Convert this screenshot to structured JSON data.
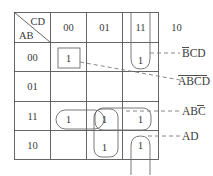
{
  "kmap": {
    "title": "Karnaugh Map",
    "corner": {
      "col_var_label": "CD",
      "row_var_label": "AB"
    },
    "column_headers": [
      "00",
      "01",
      "11",
      "10"
    ],
    "row_headers": [
      "00",
      "01",
      "11",
      "10"
    ],
    "cells": [
      {
        "row": "00",
        "col": "00",
        "value": "1"
      },
      {
        "row": "00",
        "col": "01",
        "value": ""
      },
      {
        "row": "00",
        "col": "11",
        "value": "1"
      },
      {
        "row": "00",
        "col": "10",
        "value": ""
      },
      {
        "row": "01",
        "col": "00",
        "value": ""
      },
      {
        "row": "01",
        "col": "01",
        "value": ""
      },
      {
        "row": "01",
        "col": "11",
        "value": ""
      },
      {
        "row": "01",
        "col": "10",
        "value": ""
      },
      {
        "row": "11",
        "col": "00",
        "value": "1"
      },
      {
        "row": "11",
        "col": "01",
        "value": "1"
      },
      {
        "row": "11",
        "col": "11",
        "value": "1"
      },
      {
        "row": "11",
        "col": "10",
        "value": ""
      },
      {
        "row": "10",
        "col": "00",
        "value": ""
      },
      {
        "row": "10",
        "col": "01",
        "value": "1"
      },
      {
        "row": "10",
        "col": "11",
        "value": "1"
      },
      {
        "row": "10",
        "col": "10",
        "value": ""
      }
    ],
    "cell_values_flat": [
      "1",
      "",
      "1",
      "",
      "",
      "",
      "",
      "",
      "1",
      "1",
      "1",
      "",
      "",
      "1",
      "1",
      ""
    ],
    "annotations": [
      {
        "id": "annotation-bcd",
        "text": "BCD",
        "overbar": "B",
        "term": "B'CD"
      },
      {
        "id": "annotation-abcd",
        "text": "ABCD",
        "overbar": "ABCD",
        "term": "A'B'C'D'"
      },
      {
        "id": "annotation-abc",
        "text": "ABC",
        "overbar": "C",
        "term": "ABC'"
      },
      {
        "id": "annotation-ad",
        "text": "AD",
        "overbar": "",
        "term": "AD"
      }
    ],
    "groups": [
      {
        "id": "group-single-boxed",
        "shape": "square",
        "cells": "row00-col00"
      },
      {
        "id": "group-wrap-top",
        "shape": "u-open-top",
        "cells": "row00-col11"
      },
      {
        "id": "group-pair-row11",
        "shape": "oval",
        "cells": "row11-col00,row11-col01"
      },
      {
        "id": "group-pair-col01",
        "shape": "rounded-rect-v",
        "cells": "row11-col01,row10-col01"
      },
      {
        "id": "group-pair-row11b",
        "shape": "rounded-rect-h",
        "cells": "row11-col01,row11-col11"
      },
      {
        "id": "group-wrap-bottom",
        "shape": "u-open-bottom",
        "cells": "row10-col11"
      }
    ],
    "colors": {
      "grid": "#555555",
      "group": "#6b6b6b",
      "leader": "#7a7a7a",
      "text": "#3a3a3a",
      "background": "#ffffff"
    }
  }
}
